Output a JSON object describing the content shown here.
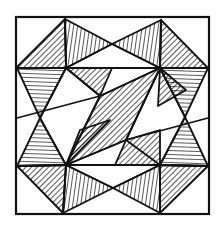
{
  "figure": {
    "stroke_color": "#111111",
    "background": "#ffffff",
    "outer_square": [
      16,
      17,
      209,
      214
    ],
    "hatch_spacing": 4,
    "shapes": [
      {
        "name": "tl-upper",
        "points": [
          [
            16,
            68
          ],
          [
            65,
            19
          ],
          [
            66,
            68
          ]
        ],
        "hatch": "diag-down"
      },
      {
        "name": "tl-top",
        "points": [
          [
            65,
            19
          ],
          [
            112,
            44
          ],
          [
            66,
            68
          ]
        ],
        "hatch": "vertical"
      },
      {
        "name": "tl-lower",
        "points": [
          [
            17,
            68
          ],
          [
            66,
            68
          ],
          [
            40,
            118
          ]
        ],
        "hatch": "horizontal"
      },
      {
        "name": "tl-inner",
        "points": [
          [
            66,
            68
          ],
          [
            112,
            68
          ],
          [
            100,
            96
          ]
        ],
        "hatch": "diag-down"
      },
      {
        "name": "tr-left",
        "points": [
          [
            112,
            44
          ],
          [
            161,
            20
          ],
          [
            160,
            68
          ]
        ],
        "hatch": "vertical"
      },
      {
        "name": "tr-upper",
        "points": [
          [
            161,
            20
          ],
          [
            208,
            68
          ],
          [
            160,
            68
          ]
        ],
        "hatch": "diag-down"
      },
      {
        "name": "tr-lower",
        "points": [
          [
            160,
            68
          ],
          [
            208,
            68
          ],
          [
            185,
            117
          ]
        ],
        "hatch": "horizontal"
      },
      {
        "name": "tr-inner",
        "points": [
          [
            160,
            68
          ],
          [
            186,
            90
          ],
          [
            158,
            106
          ]
        ],
        "hatch": "diag-down"
      },
      {
        "name": "center",
        "points": [
          [
            100,
            96
          ],
          [
            160,
            68
          ],
          [
            126,
            140
          ],
          [
            66,
            165
          ]
        ],
        "hatch": "diag-down"
      },
      {
        "name": "br-upper",
        "points": [
          [
            185,
            117
          ],
          [
            208,
            166
          ],
          [
            160,
            165
          ]
        ],
        "hatch": "horizontal"
      },
      {
        "name": "br-right",
        "points": [
          [
            160,
            165
          ],
          [
            208,
            166
          ],
          [
            160,
            213
          ]
        ],
        "hatch": "diag-down"
      },
      {
        "name": "br-lower",
        "points": [
          [
            113,
            188
          ],
          [
            160,
            165
          ],
          [
            160,
            213
          ]
        ],
        "hatch": "vertical"
      },
      {
        "name": "br-inner",
        "points": [
          [
            126,
            140
          ],
          [
            160,
            130
          ],
          [
            160,
            165
          ],
          [
            115,
            165
          ]
        ],
        "hatch": "diag-down"
      },
      {
        "name": "bl-upper",
        "points": [
          [
            40,
            118
          ],
          [
            66,
            165
          ],
          [
            17,
            166
          ]
        ],
        "hatch": "horizontal"
      },
      {
        "name": "bl-lower",
        "points": [
          [
            17,
            166
          ],
          [
            66,
            165
          ],
          [
            63,
            213
          ]
        ],
        "hatch": "diag-down"
      },
      {
        "name": "bl-right",
        "points": [
          [
            66,
            165
          ],
          [
            113,
            188
          ],
          [
            63,
            213
          ]
        ],
        "hatch": "vertical"
      },
      {
        "name": "bl-inner",
        "points": [
          [
            66,
            165
          ],
          [
            80,
            130
          ],
          [
            110,
            120
          ]
        ],
        "hatch": "diag-down"
      }
    ],
    "lines": [
      [
        [
          16,
          68
        ],
        [
          66,
          68
        ]
      ],
      [
        [
          66,
          68
        ],
        [
          160,
          68
        ]
      ],
      [
        [
          160,
          68
        ],
        [
          208,
          68
        ]
      ],
      [
        [
          16,
          166
        ],
        [
          66,
          165
        ]
      ],
      [
        [
          66,
          165
        ],
        [
          160,
          165
        ]
      ],
      [
        [
          160,
          165
        ],
        [
          208,
          166
        ]
      ],
      [
        [
          66,
          68
        ],
        [
          40,
          118
        ]
      ],
      [
        [
          40,
          118
        ],
        [
          66,
          165
        ]
      ],
      [
        [
          160,
          68
        ],
        [
          185,
          117
        ]
      ],
      [
        [
          185,
          117
        ],
        [
          160,
          165
        ]
      ],
      [
        [
          65,
          19
        ],
        [
          66,
          68
        ]
      ],
      [
        [
          161,
          20
        ],
        [
          160,
          68
        ]
      ],
      [
        [
          66,
          165
        ],
        [
          63,
          213
        ]
      ],
      [
        [
          160,
          165
        ],
        [
          160,
          213
        ]
      ],
      [
        [
          112,
          44
        ],
        [
          66,
          68
        ]
      ],
      [
        [
          112,
          44
        ],
        [
          160,
          68
        ]
      ],
      [
        [
          113,
          188
        ],
        [
          66,
          165
        ]
      ],
      [
        [
          113,
          188
        ],
        [
          160,
          165
        ]
      ],
      [
        [
          66,
          68
        ],
        [
          100,
          96
        ]
      ],
      [
        [
          160,
          68
        ],
        [
          126,
          140
        ]
      ],
      [
        [
          100,
          96
        ],
        [
          66,
          165
        ]
      ],
      [
        [
          126,
          140
        ],
        [
          160,
          165
        ]
      ],
      [
        [
          100,
          96
        ],
        [
          160,
          68
        ]
      ],
      [
        [
          66,
          165
        ],
        [
          126,
          140
        ]
      ],
      [
        [
          17,
          118
        ],
        [
          100,
          96
        ]
      ],
      [
        [
          126,
          140
        ],
        [
          208,
          118
        ]
      ]
    ]
  }
}
